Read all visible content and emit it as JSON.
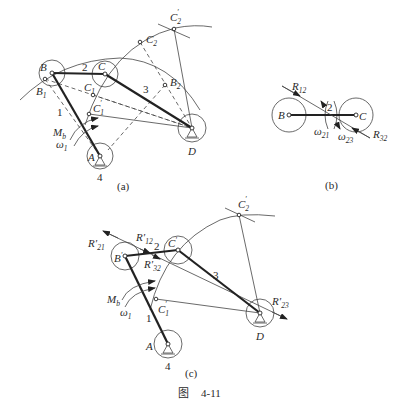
{
  "figure": {
    "caption_prefix": "图",
    "caption_number": "4-11"
  },
  "panel_a": {
    "label": "(a)",
    "points": {
      "B": "B",
      "C": "C",
      "D": "D",
      "A": "A",
      "B1": "B",
      "B1_sub": "1",
      "B2": "B",
      "B2_sub": "2",
      "C1": "C",
      "C1_sub": "1",
      "C1p": "C",
      "C1p_sub": "1",
      "C1p_prime": "′",
      "C2": "C",
      "C2_sub": "2",
      "C2p": "C",
      "C2p_sub": "2",
      "C2p_prime": "′"
    },
    "links": {
      "l1": "1",
      "l2": "2",
      "l3": "3",
      "l4": "4"
    },
    "moment": "M",
    "moment_sub": "b",
    "omega": "ω",
    "omega_sub": "1"
  },
  "panel_b": {
    "label": "(b)",
    "points": {
      "B": "B",
      "C": "C"
    },
    "link": "2",
    "R12": "R",
    "R12_sub": "12",
    "R32": "R",
    "R32_sub": "32",
    "w21": "ω",
    "w21_sub": "21",
    "w23": "ω",
    "w23_sub": "23"
  },
  "panel_c": {
    "label": "(c)",
    "points": {
      "Bp": "B",
      "Bp_prime": "′",
      "Cp": "C",
      "Cp_prime": "′",
      "D": "D",
      "A": "A",
      "C1p": "C",
      "C1p_sub": "1",
      "C1p_prime": "′",
      "C2p": "C",
      "C2p_sub": "2",
      "C2p_prime": "′"
    },
    "links": {
      "l1": "1",
      "l2": "2",
      "l3": "3",
      "l4": "4"
    },
    "R21": "R′",
    "R21_sub": "21",
    "R12": "R′",
    "R12_sub": "12",
    "R32": "R′",
    "R32_sub": "32",
    "R23": "R′",
    "R23_sub": "23",
    "moment": "M",
    "moment_sub": "b",
    "omega": "ω",
    "omega_sub": "1"
  }
}
